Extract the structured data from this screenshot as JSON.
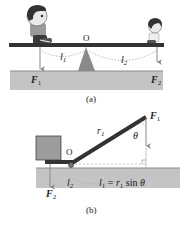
{
  "panel_a": {
    "caption": "(a)",
    "pivot_label": "O",
    "force_left": {
      "symbol": "F",
      "sub": "1"
    },
    "force_right": {
      "symbol": "F",
      "sub": "2"
    },
    "arm_left": {
      "symbol": "l",
      "sub": "1"
    },
    "arm_right": {
      "symbol": "l",
      "sub": "2"
    },
    "figures": [
      "larger-child-left",
      "smaller-child-right"
    ]
  },
  "panel_b": {
    "caption": "(b)",
    "pivot_label": "O",
    "force_top": {
      "symbol": "F",
      "sub": "1"
    },
    "force_bottom": {
      "symbol": "F",
      "sub": "2"
    },
    "radius": {
      "symbol": "r",
      "sub": "1"
    },
    "angle": "θ",
    "arm_left": {
      "symbol": "l",
      "sub": "2"
    },
    "equation": {
      "lhs": "l",
      "lhs_sub": "1",
      "eq": " = ",
      "r": "r",
      "r_sub": "1",
      "func": " sin ",
      "angle": "θ"
    }
  },
  "colors": {
    "plank": "#333333",
    "ground": "#c4c4c4",
    "ground_edge": "#8a8a8a",
    "fulcrum": "#8a8a8a",
    "box": "#9c9c9c",
    "arrow": "#8a8a8a",
    "dashed": "#aaaaaa"
  }
}
